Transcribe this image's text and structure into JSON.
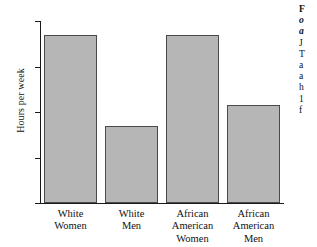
{
  "figure": {
    "axis": {
      "ylabel": "Hours per week",
      "yticks": [
        "40",
        "30",
        "20",
        "10",
        "0"
      ]
    },
    "xticks": [
      "White\nWomen",
      "White\nMen",
      "African\nAmerican\nWomen",
      "African\nAmerican\nMen"
    ]
  },
  "caption": {
    "lines": [
      "F",
      "o",
      "a",
      "J",
      "T",
      "a",
      "a",
      "h",
      "1",
      "f"
    ]
  },
  "colors": {
    "bar_fill": "#b6b6b6",
    "bar_edge": "#4a4a4a",
    "axis": "#1a1a1a",
    "background": "#ffffff"
  },
  "chart_data": {
    "type": "bar",
    "title": "",
    "xlabel": "",
    "ylabel": "Hours per week",
    "categories": [
      "White Women",
      "White Men",
      "African American Women",
      "African American Men"
    ],
    "values": [
      37,
      17,
      37,
      21.5
    ],
    "ylim": [
      0,
      40
    ],
    "yticks": [
      0,
      10,
      20,
      30,
      40
    ],
    "grid": false,
    "legend": "none"
  }
}
